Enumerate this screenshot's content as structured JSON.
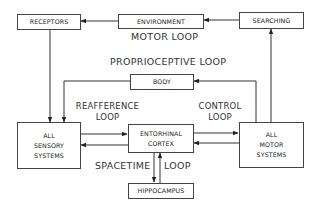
{
  "diagram": {
    "nodes": {
      "receptors": "RECEPTORS",
      "environment": "ENVIRONMENT",
      "searching": "SEARCHING",
      "body": "BODY",
      "sensory": [
        "ALL",
        "SENSORY",
        "SYSTEMS"
      ],
      "entorhinal": [
        "ENTORHINAL",
        "CORTEX"
      ],
      "motor": [
        "ALL",
        "MOTOR",
        "SYSTEMS"
      ],
      "hippocampus": "HIPPOCAMPUS"
    },
    "loops": {
      "motor_loop": "MOTOR LOOP",
      "proprioceptive_loop": "PROPRIOCEPTIVE LOOP",
      "reafference": [
        "REAFFERENCE",
        "LOOP"
      ],
      "control": [
        "CONTROL",
        "LOOP"
      ],
      "spacetime": "SPACETIME",
      "spacetime_loop": "LOOP"
    },
    "edges": [
      {
        "from": "searching",
        "to": "environment"
      },
      {
        "from": "environment",
        "to": "receptors"
      },
      {
        "from": "receptors",
        "to": "sensory"
      },
      {
        "from": "body",
        "to": "sensory"
      },
      {
        "from": "motor",
        "to": "body"
      },
      {
        "from": "motor",
        "to": "searching"
      },
      {
        "from": "sensory",
        "to": "entorhinal"
      },
      {
        "from": "entorhinal",
        "to": "sensory"
      },
      {
        "from": "entorhinal",
        "to": "motor"
      },
      {
        "from": "motor",
        "to": "entorhinal"
      },
      {
        "from": "entorhinal",
        "to": "hippocampus"
      },
      {
        "from": "hippocampus",
        "to": "entorhinal"
      }
    ]
  }
}
